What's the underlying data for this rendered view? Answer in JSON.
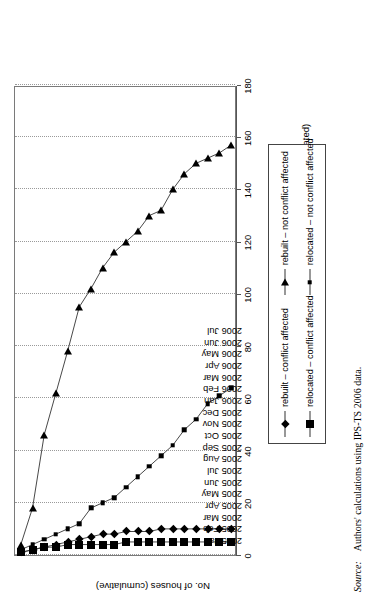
{
  "chart_data": {
    "type": "line",
    "title": "",
    "xlabel": "Month (when rebuilding started or relocated)",
    "ylabel": "No. of houses (cumulative)",
    "ylim": [
      0,
      180
    ],
    "ytick_step": 20,
    "yticks": [
      "0",
      "20",
      "40",
      "60",
      "80",
      "100",
      "120",
      "140",
      "160",
      "180"
    ],
    "grid": true,
    "legend_position": "below-axis",
    "categories": [
      "2005 Jan",
      "2005 Feb",
      "2005 Mar",
      "2005 Apr",
      "2005 May",
      "2005 Jun",
      "2005 Jul",
      "2005 Aug",
      "2005 Sep",
      "2005 Oct",
      "2005 Nov",
      "2005 Dec",
      "2006 Jan",
      "2006 Feb",
      "2006 Mar",
      "2006 Apr",
      "2006 May",
      "2006 Jun",
      "2006 Jul"
    ],
    "series": [
      {
        "name": "rebuilt – conflict affected",
        "marker": "diamond",
        "values": [
          1,
          2,
          3,
          4,
          5,
          6,
          7,
          8,
          8,
          9,
          9,
          9,
          10,
          10,
          10,
          10,
          10,
          10,
          10
        ]
      },
      {
        "name": "relocated – conflict affected",
        "marker": "large-square",
        "values": [
          1,
          2,
          3,
          3,
          4,
          4,
          4,
          4,
          4,
          5,
          5,
          5,
          5,
          5,
          5,
          5,
          5,
          5,
          5
        ]
      },
      {
        "name": "rebuilt – not conflict affected",
        "marker": "triangle",
        "values": [
          4,
          18,
          46,
          62,
          78,
          95,
          102,
          110,
          116,
          120,
          124,
          130,
          132,
          140,
          146,
          150,
          152,
          154,
          157
        ]
      },
      {
        "name": "relocated – not conflict affected",
        "marker": "small-square",
        "values": [
          2,
          4,
          6,
          8,
          10,
          12,
          18,
          20,
          22,
          26,
          30,
          34,
          38,
          42,
          48,
          52,
          58,
          61,
          64
        ]
      }
    ]
  },
  "source": {
    "label": "Source:",
    "text": "Authors' calculations using IPS-TS 2006 data."
  }
}
